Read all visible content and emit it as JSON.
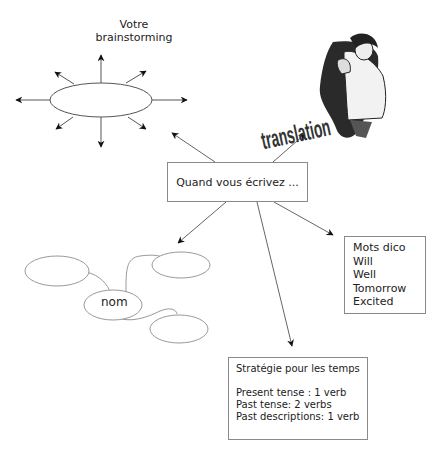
{
  "diagram": {
    "brainstorming": {
      "title_line1": "Votre",
      "title_line2": "brainstorming"
    },
    "clipart": {
      "word": "translation",
      "description": "cartoon figure leaning against the word translation"
    },
    "central_node": {
      "label": "Quand vous écrivez ..."
    },
    "vocabulary_box": {
      "items": [
        "Mots dico",
        "Will",
        "Well",
        "Tomorrow",
        "Excited"
      ]
    },
    "strategy_box": {
      "heading": "Stratégie pour les temps",
      "lines": [
        "Present tense : 1 verb",
        "Past tense: 2 verbs",
        "Past descriptions: 1 verb"
      ]
    },
    "word_web": {
      "center_label": "nom",
      "empty_bubbles": 3
    }
  }
}
